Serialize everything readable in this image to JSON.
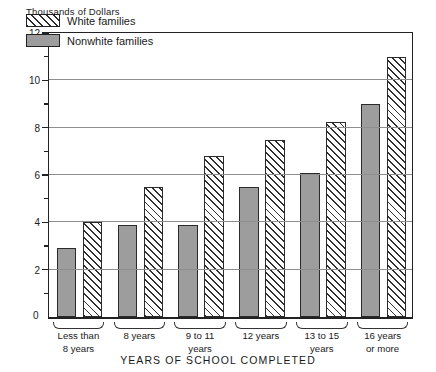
{
  "chart_data": {
    "type": "bar",
    "title": "",
    "ylabel": "Thousands of Dollars",
    "xlabel": "YEARS OF SCHOOL COMPLETED",
    "ylim": [
      0,
      12
    ],
    "ytick_labels": [
      "0",
      "2",
      "4",
      "6",
      "8",
      "10",
      "12"
    ],
    "ytick_values": [
      0,
      2,
      4,
      6,
      8,
      10,
      12
    ],
    "minor_tick_values": [
      1,
      3,
      5,
      7,
      9,
      11
    ],
    "grid": "horizontal",
    "legend_position": "top-left-inside",
    "categories": [
      "Less than\n8 years",
      "8 years",
      "9 to 11\nyears",
      "12 years",
      "13 to 15\nyears",
      "16 years\nor more"
    ],
    "series": [
      {
        "name": "Nonwhite families",
        "fill": "solid-gray",
        "color": "#9d9d9d",
        "values": [
          2.9,
          3.9,
          3.9,
          5.5,
          6.1,
          9.0
        ]
      },
      {
        "name": "White families",
        "fill": "diagonal-hatch",
        "color": "#ffffff",
        "values": [
          4.0,
          5.5,
          6.8,
          7.5,
          8.25,
          11.0
        ]
      }
    ],
    "bar_order_within_group": [
      "Nonwhite families",
      "White families"
    ]
  },
  "legend": {
    "items": [
      {
        "label": "White families",
        "swatch": "hatch-swatch"
      },
      {
        "label": "Nonwhite families",
        "swatch": "solid-swatch"
      }
    ]
  },
  "axis": {
    "y_title": "Thousands of Dollars",
    "x_title": "YEARS OF SCHOOL COMPLETED",
    "zero_label": "0"
  },
  "colors": {
    "nonwhite_fill": "#9d9d9d",
    "white_fill": "#ffffff",
    "outline": "#2b2b2b",
    "gridline": "#8e8e8e",
    "axis": "#222222"
  }
}
